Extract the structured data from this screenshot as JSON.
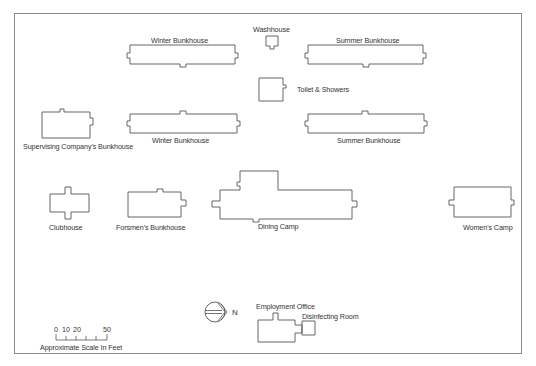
{
  "diagram": {
    "type": "site-plan",
    "colors": {
      "outline": "#555555",
      "frame": "#8a8a8a",
      "text": "#333333",
      "background": "#ffffff"
    },
    "buildings": [
      {
        "id": "winter-bunkhouse-1",
        "label": "Winter Bunkhouse"
      },
      {
        "id": "washhouse",
        "label": "Washhouse"
      },
      {
        "id": "summer-bunkhouse-1",
        "label": "Summer Bunkhouse"
      },
      {
        "id": "toilet-showers",
        "label": "Toilet & Showers"
      },
      {
        "id": "supervising-bunkhouse",
        "label": "Supervising Company's Bunkhouse"
      },
      {
        "id": "winter-bunkhouse-2",
        "label": "Winter Bunkhouse"
      },
      {
        "id": "summer-bunkhouse-2",
        "label": "Summer Bunkhouse"
      },
      {
        "id": "clubhouse",
        "label": "Clubhouse"
      },
      {
        "id": "foremens-bunkhouse",
        "label": "Forsmen's Bunkhouse"
      },
      {
        "id": "dining-camp",
        "label": "Dining Camp"
      },
      {
        "id": "womens-camp",
        "label": "Women's Camp"
      },
      {
        "id": "employment-office",
        "label": "Employment Office"
      },
      {
        "id": "disinfecting-room",
        "label": "Disinfecting Room"
      }
    ],
    "scale": {
      "ticks": [
        "0",
        "10",
        "20",
        "50"
      ],
      "caption": "Approximate Scale In Feet"
    },
    "north_arrow": {
      "label": "N",
      "icon": "north-arrow-icon"
    }
  }
}
